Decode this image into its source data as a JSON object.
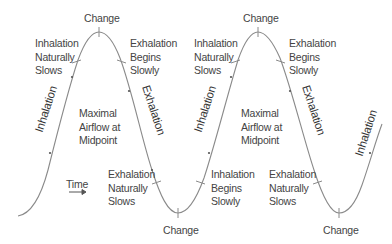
{
  "diagram": {
    "type": "breathing-cycle-wave",
    "colors": {
      "curve": "#8a8a8a",
      "text": "#444444",
      "background": "#ffffff"
    },
    "change_labels": [
      {
        "text": "Change",
        "position": "peak-1"
      },
      {
        "text": "Change",
        "position": "trough-1"
      },
      {
        "text": "Change",
        "position": "peak-2"
      },
      {
        "text": "Change",
        "position": "trough-2"
      }
    ],
    "phase_labels": [
      {
        "text": "Inhalation",
        "segment": "rise-1"
      },
      {
        "text": "Exhalation",
        "segment": "fall-1"
      },
      {
        "text": "Inhalation",
        "segment": "rise-2"
      },
      {
        "text": "Exhalation",
        "segment": "fall-2"
      },
      {
        "text": "Inhalation",
        "segment": "rise-3"
      }
    ],
    "annotations": [
      {
        "lines": [
          "Inhalation",
          "Naturally",
          "Slows"
        ]
      },
      {
        "lines": [
          "Exhalation",
          "Begins",
          "Slowly"
        ]
      },
      {
        "lines": [
          "Maximal",
          "Airflow at",
          "Midpoint"
        ]
      },
      {
        "lines": [
          "Exhalation",
          "Naturally",
          "Slows"
        ]
      },
      {
        "lines": [
          "Inhalation",
          "Naturally",
          "Slows"
        ]
      },
      {
        "lines": [
          "Exhalation",
          "Begins",
          "Slowly"
        ]
      },
      {
        "lines": [
          "Maximal",
          "Airflow at",
          "Midpoint"
        ]
      },
      {
        "lines": [
          "Inhalation",
          "Begins",
          "Slowly"
        ]
      },
      {
        "lines": [
          "Exhalation",
          "Naturally",
          "Slows"
        ]
      }
    ],
    "time_axis": {
      "label": "Time",
      "arrow": "right-arrow"
    }
  }
}
